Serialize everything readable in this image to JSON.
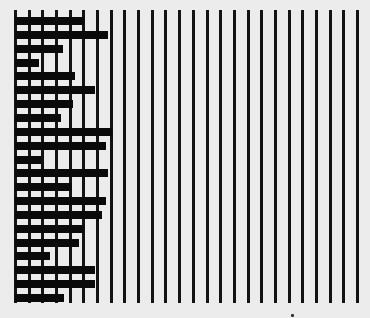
{
  "chart_data": {
    "type": "bar",
    "orientation": "horizontal",
    "title": "",
    "xlabel": "",
    "ylabel": "",
    "categories": [
      "1",
      "2",
      "3",
      "4",
      "5",
      "6",
      "7",
      "8",
      "9",
      "10",
      "11",
      "12",
      "13",
      "14",
      "15",
      "16",
      "17",
      "18",
      "19",
      "20",
      "21"
    ],
    "values": [
      5.0,
      6.7,
      3.4,
      1.7,
      4.3,
      5.8,
      4.2,
      3.3,
      7.0,
      6.6,
      1.8,
      6.7,
      4.1,
      6.6,
      6.3,
      5.0,
      4.6,
      2.5,
      5.8,
      5.8,
      3.5
    ],
    "xlim": [
      0,
      25
    ],
    "grid": "vertical",
    "gridline_count": 26,
    "legend": null,
    "tick_labels_visible": false,
    "colors": {
      "bar": "#0a0a0a",
      "grid": "#141414",
      "background": "#ececec"
    }
  },
  "layout": {
    "plot_left": 15,
    "plot_top": 10,
    "plot_bottom": 303,
    "grid_spacing": 13.68,
    "first_bar_top": 17,
    "bar_pitch": 13.85,
    "bar_height": 8
  },
  "artifacts": {
    "speck": {
      "x": 291,
      "y": 314
    }
  }
}
